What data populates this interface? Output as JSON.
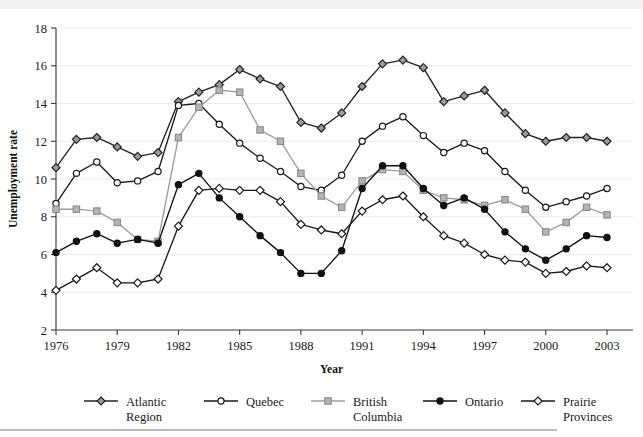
{
  "top_fragment": "",
  "chart_data": {
    "type": "line",
    "title": "",
    "xlabel": "Year",
    "ylabel": "Unemployment rate",
    "xlim": [
      1976,
      2003
    ],
    "ylim": [
      2,
      18
    ],
    "yticks": [
      2,
      4,
      6,
      8,
      10,
      12,
      14,
      16,
      18
    ],
    "xticks": [
      1976,
      1979,
      1982,
      1985,
      1988,
      1991,
      1994,
      1997,
      2000,
      2003
    ],
    "grid": true,
    "legend_position": "bottom",
    "x": [
      1976,
      1977,
      1978,
      1979,
      1980,
      1981,
      1982,
      1983,
      1984,
      1985,
      1986,
      1987,
      1988,
      1989,
      1990,
      1991,
      1992,
      1993,
      1994,
      1995,
      1996,
      1997,
      1998,
      1999,
      2000,
      2001,
      2002,
      2003
    ],
    "series": [
      {
        "name": "Atlantic Region",
        "legend_label_line1": "Atlantic",
        "legend_label_line2": "Region",
        "marker": "diamond-gray",
        "color": "#222222",
        "marker_fill": "#9b9b9b",
        "values": [
          10.6,
          12.1,
          12.2,
          11.7,
          11.2,
          11.4,
          14.1,
          14.6,
          15.0,
          15.8,
          15.3,
          14.9,
          13.0,
          12.7,
          13.5,
          14.9,
          16.1,
          16.3,
          15.9,
          14.1,
          14.4,
          14.7,
          13.5,
          12.4,
          12.0,
          12.2,
          12.2,
          12.0
        ]
      },
      {
        "name": "Quebec",
        "legend_label_line1": "Quebec",
        "legend_label_line2": "",
        "marker": "circle-open",
        "color": "#1a1a1a",
        "marker_fill": "#ffffff",
        "values": [
          8.7,
          10.3,
          10.9,
          9.8,
          9.9,
          10.4,
          13.9,
          14.0,
          12.9,
          11.9,
          11.1,
          10.4,
          9.6,
          9.4,
          10.2,
          12.0,
          12.8,
          13.3,
          12.3,
          11.4,
          11.9,
          11.5,
          10.4,
          9.4,
          8.5,
          8.8,
          9.1,
          9.5
        ]
      },
      {
        "name": "British Columbia",
        "legend_label_line1": "British",
        "legend_label_line2": "Columbia",
        "marker": "square-gray",
        "color": "#9d9d9d",
        "marker_fill": "#b4b4b4",
        "values": [
          8.4,
          8.4,
          8.3,
          7.7,
          6.8,
          6.7,
          12.2,
          13.8,
          14.7,
          14.6,
          12.6,
          12.0,
          10.3,
          9.1,
          8.5,
          9.9,
          10.5,
          10.4,
          9.4,
          9.0,
          8.9,
          8.6,
          8.9,
          8.4,
          7.2,
          7.7,
          8.5,
          8.1
        ]
      },
      {
        "name": "Ontario",
        "legend_label_line1": "Ontario",
        "legend_label_line2": "",
        "marker": "circle-filled",
        "color": "#111111",
        "marker_fill": "#111111",
        "values": [
          6.1,
          6.7,
          7.1,
          6.6,
          6.8,
          6.6,
          9.7,
          10.3,
          9.0,
          8.0,
          7.0,
          6.1,
          5.0,
          5.0,
          6.2,
          9.5,
          10.7,
          10.7,
          9.5,
          8.6,
          9.0,
          8.4,
          7.2,
          6.3,
          5.7,
          6.3,
          7.0,
          6.9
        ]
      },
      {
        "name": "Prairie Provinces",
        "legend_label_line1": "Prairie",
        "legend_label_line2": "Provinces",
        "marker": "diamond-open",
        "color": "#1a1a1a",
        "marker_fill": "#ffffff",
        "values": [
          4.1,
          4.7,
          5.3,
          4.5,
          4.5,
          4.7,
          7.5,
          9.4,
          9.5,
          9.4,
          9.4,
          8.8,
          7.6,
          7.3,
          7.1,
          8.3,
          8.9,
          9.1,
          8.0,
          7.0,
          6.6,
          6.0,
          5.7,
          5.6,
          5.0,
          5.1,
          5.4,
          5.3
        ]
      }
    ]
  }
}
